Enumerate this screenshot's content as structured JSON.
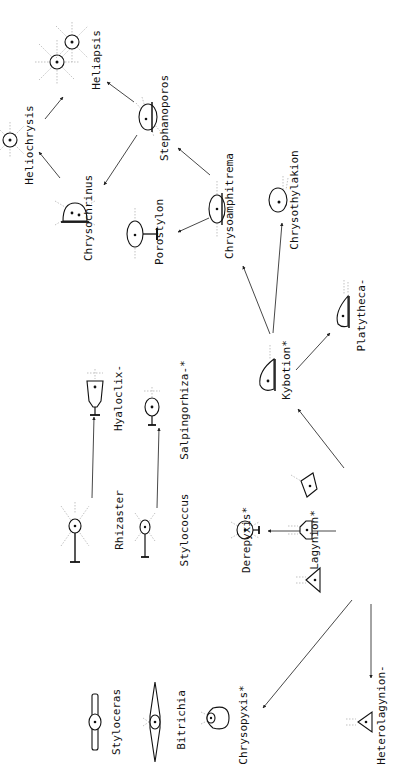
{
  "diagram": {
    "title": "",
    "orientation": "rotated 90deg counter-clockwise (text reads bottom-to-top)",
    "nodes": [
      {
        "id": "heliapsis",
        "label": "Heliapsis",
        "marker": "",
        "x": 85,
        "y": 50,
        "label_x": 100,
        "label_y": 60
      },
      {
        "id": "heliochrysis",
        "label": "Heliochrysis",
        "marker": "",
        "x": 10,
        "y": 140,
        "label_x": 33,
        "label_y": 145
      },
      {
        "id": "stephanoporos",
        "label": "Stephanoporos",
        "marker": "",
        "x": 148,
        "y": 117,
        "label_x": 168,
        "label_y": 118
      },
      {
        "id": "chrysochrinus",
        "label": "Chrysochrinus",
        "marker": "",
        "x": 75,
        "y": 213,
        "label_x": 92,
        "label_y": 218
      },
      {
        "id": "porostylon",
        "label": "Porostylon",
        "marker": "",
        "x": 135,
        "y": 234,
        "label_x": 163,
        "label_y": 232
      },
      {
        "id": "chrysoamphitrema",
        "label": "Chrysoamphitrema",
        "marker": "",
        "x": 217,
        "y": 209,
        "label_x": 233,
        "label_y": 206
      },
      {
        "id": "chrysothylakion",
        "label": "Chrysothylakion",
        "marker": "",
        "x": 278,
        "y": 200,
        "label_x": 298,
        "label_y": 200
      },
      {
        "id": "kybotion",
        "label": "Kybotion",
        "marker": "*",
        "x": 268,
        "y": 375,
        "label_x": 290,
        "label_y": 370
      },
      {
        "id": "platytheca",
        "label": "Platytheca",
        "marker": "-",
        "x": 344,
        "y": 312,
        "label_x": 365,
        "label_y": 315
      },
      {
        "id": "hyaloclix",
        "label": "Hyaloclix",
        "marker": "-",
        "x": 95,
        "y": 393,
        "label_x": 122,
        "label_y": 398
      },
      {
        "id": "salpingorhiza",
        "label": "Salpingorhiza",
        "marker": "-*",
        "x": 152,
        "y": 407,
        "label_x": 188,
        "label_y": 410
      },
      {
        "id": "rhizaster",
        "label": "Rhizaster",
        "marker": "",
        "x": 75,
        "y": 526,
        "label_x": 123,
        "label_y": 520
      },
      {
        "id": "stylococcus",
        "label": "Stylococcus",
        "marker": "",
        "x": 145,
        "y": 527,
        "label_x": 188,
        "label_y": 530
      },
      {
        "id": "derepyxis",
        "label": "Derepyxis",
        "marker": "*",
        "x": 245,
        "y": 530,
        "label_x": 250,
        "label_y": 540
      },
      {
        "id": "lagynion",
        "label": "Lagynion",
        "marker": "*",
        "x": 302,
        "y": 530,
        "label_x": 318,
        "label_y": 540
      },
      {
        "id": "lagynion_b",
        "label": "",
        "marker": "",
        "x": 305,
        "y": 485,
        "label_x": 0,
        "label_y": 0
      },
      {
        "id": "lagynion_c",
        "label": "",
        "marker": "",
        "x": 310,
        "y": 580,
        "label_x": 0,
        "label_y": 0
      },
      {
        "id": "chrysopyxis",
        "label": "Chrysopyxis",
        "marker": "*",
        "x": 215,
        "y": 718,
        "label_x": 247,
        "label_y": 725
      },
      {
        "id": "heterolagynion",
        "label": "Heterolagynion",
        "marker": "-",
        "x": 362,
        "y": 722,
        "label_x": 385,
        "label_y": 715
      },
      {
        "id": "styloceras",
        "label": "Styloceras",
        "marker": "",
        "x": 95,
        "y": 722,
        "label_x": 120,
        "label_y": 722
      },
      {
        "id": "bitrichia",
        "label": "Bitrichia",
        "marker": "",
        "x": 155,
        "y": 722,
        "label_x": 185,
        "label_y": 720
      }
    ],
    "edges": [
      {
        "from": "lagynion",
        "to": "derepyxis",
        "x1": 336,
        "y1": 531,
        "x2": 268,
        "y2": 531
      },
      {
        "from": "lagynion_c",
        "to": "chrysopyxis",
        "x1": 352,
        "y1": 600,
        "x2": 263,
        "y2": 708
      },
      {
        "from": "lagynion_c",
        "to": "heterolagynion",
        "x1": 371,
        "y1": 604,
        "x2": 371,
        "y2": 678
      },
      {
        "from": "lagynion_b",
        "to": "kybotion",
        "x1": 344,
        "y1": 468,
        "x2": 298,
        "y2": 409
      },
      {
        "from": "kybotion",
        "to": "chrysoamphitrema",
        "x1": 270,
        "y1": 334,
        "x2": 243,
        "y2": 266
      },
      {
        "from": "kybotion",
        "to": "chrysothylakion",
        "x1": 273,
        "y1": 333,
        "x2": 282,
        "y2": 223
      },
      {
        "from": "kybotion",
        "to": "platytheca",
        "x1": 296,
        "y1": 370,
        "x2": 330,
        "y2": 333
      },
      {
        "from": "chrysoamphitrema",
        "to": "porostylon",
        "x1": 209,
        "y1": 218,
        "x2": 178,
        "y2": 232
      },
      {
        "from": "chrysoamphitrema",
        "to": "stephanoporos",
        "x1": 210,
        "y1": 175,
        "x2": 178,
        "y2": 148
      },
      {
        "from": "stephanoporos",
        "to": "chrysochrinus",
        "x1": 137,
        "y1": 135,
        "x2": 104,
        "y2": 185
      },
      {
        "from": "stephanoporos",
        "to": "heliapsis",
        "x1": 134,
        "y1": 102,
        "x2": 107,
        "y2": 82
      },
      {
        "from": "chrysochrinus",
        "to": "heliochrysis",
        "x1": 60,
        "y1": 178,
        "x2": 39,
        "y2": 152
      },
      {
        "from": "heliochrysis",
        "to": "heliapsis",
        "x1": 45,
        "y1": 119,
        "x2": 63,
        "y2": 97
      },
      {
        "from": "rhizaster",
        "to": "hyaloclix",
        "x1": 92,
        "y1": 498,
        "x2": 94,
        "y2": 417
      },
      {
        "from": "stylococcus",
        "to": "salpingorhiza",
        "x1": 157,
        "y1": 508,
        "x2": 159,
        "y2": 428
      }
    ]
  }
}
